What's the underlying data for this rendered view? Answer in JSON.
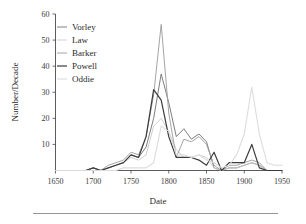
{
  "figure": {
    "background": "#ffffff",
    "bottom_rule": true
  },
  "chart_data": {
    "type": "line",
    "title": "",
    "xlabel": "Date",
    "ylabel": "Number/Decade",
    "xlim": [
      1650,
      1950
    ],
    "ylim": [
      0,
      60
    ],
    "xticks": [
      1650,
      1700,
      1750,
      1800,
      1850,
      1900,
      1950
    ],
    "yticks": [
      10,
      20,
      30,
      40,
      50,
      60
    ],
    "grid": false,
    "legend_position": "upper-left",
    "x": [
      1650,
      1660,
      1670,
      1680,
      1690,
      1700,
      1710,
      1720,
      1730,
      1740,
      1750,
      1760,
      1770,
      1780,
      1790,
      1800,
      1810,
      1820,
      1830,
      1840,
      1850,
      1860,
      1870,
      1880,
      1890,
      1900,
      1910,
      1920,
      1930,
      1940,
      1950
    ],
    "series": [
      {
        "name": "Vorley",
        "color": "#6f6f6f",
        "width": 0.9,
        "values": [
          0,
          0,
          0,
          0,
          0,
          1,
          0,
          1,
          2,
          3,
          6,
          5,
          9,
          20,
          37,
          26,
          13,
          16,
          12,
          14,
          11,
          1,
          0,
          1,
          1,
          2,
          3,
          2,
          0,
          0,
          0
        ]
      },
      {
        "name": "Law",
        "color": "#c9c9c9",
        "width": 0.9,
        "values": [
          0,
          0,
          0,
          0,
          0,
          1,
          0,
          1,
          2,
          3,
          5,
          4,
          6,
          17,
          20,
          15,
          8,
          5,
          5,
          6,
          5,
          1,
          0,
          1,
          1,
          2,
          3,
          2,
          0,
          0,
          0
        ]
      },
      {
        "name": "Barker",
        "color": "#9a9a9a",
        "width": 0.9,
        "values": [
          0,
          0,
          0,
          0,
          0,
          1,
          0,
          2,
          3,
          4,
          7,
          6,
          13,
          29,
          56,
          22,
          5,
          12,
          11,
          13,
          10,
          2,
          0,
          2,
          2,
          3,
          4,
          3,
          0,
          0,
          0
        ]
      },
      {
        "name": "Powell",
        "color": "#3c3c3c",
        "width": 1.2,
        "values": [
          0,
          0,
          0,
          0,
          0,
          1,
          0,
          1,
          2,
          3,
          6,
          5,
          13,
          31,
          27,
          13,
          5,
          5,
          5,
          4,
          2,
          7,
          0,
          3,
          3,
          3,
          10,
          1,
          0,
          0,
          0
        ]
      },
      {
        "name": "Oddie",
        "color": "#dcdcdc",
        "width": 1.1,
        "values": [
          0,
          0,
          0,
          0,
          0,
          0,
          0,
          0,
          0,
          1,
          1,
          1,
          1,
          3,
          17,
          15,
          6,
          6,
          5,
          6,
          4,
          3,
          1,
          2,
          6,
          14,
          32,
          14,
          3,
          2,
          2
        ]
      }
    ]
  },
  "legend": {
    "entries": [
      {
        "label": "Vorley"
      },
      {
        "label": "Law"
      },
      {
        "label": "Barker"
      },
      {
        "label": "Powell"
      },
      {
        "label": "Oddie"
      }
    ]
  }
}
